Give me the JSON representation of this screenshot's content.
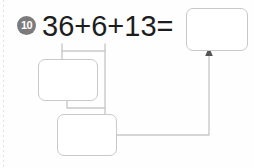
{
  "worksheet": {
    "problem_number": "10",
    "equation": "36+6+13=",
    "boxes": [
      {
        "name": "result",
        "value": ""
      },
      {
        "name": "partial",
        "value": ""
      },
      {
        "name": "sum",
        "value": ""
      }
    ],
    "colors": {
      "box_border": "#c9c9c9",
      "connector": "#c9c9c9",
      "arrow": "#555555",
      "badge_fill": "#7b7b7b",
      "badge_text": "#ffffff",
      "equation_text": "#1d1d1d",
      "page_background": "#fefefe"
    },
    "connectors": {
      "bracket_label": "bracket-under-36-plus-6",
      "arrow_label": "arrow-to-result-box"
    }
  }
}
